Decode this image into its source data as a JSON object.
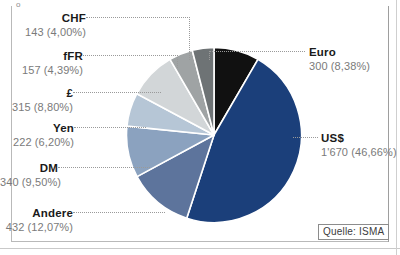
{
  "figure": {
    "source_label": "Quelle: ISMA",
    "corner_mark": "o"
  },
  "chart_data": {
    "type": "pie",
    "title": "",
    "xlabel": "",
    "ylabel": "",
    "legend_position": "callout-labels",
    "grid": false,
    "total": 3579,
    "units": "Mrd.",
    "start_angle_deg": 0,
    "direction": "clockwise",
    "categories": [
      "Euro",
      "US$",
      "Andere",
      "DM",
      "Yen",
      "£",
      "fFR",
      "CHF"
    ],
    "values": [
      300,
      1670,
      432,
      340,
      222,
      315,
      157,
      143
    ],
    "percents": [
      8.38,
      46.66,
      12.07,
      9.5,
      6.2,
      8.8,
      4.39,
      4.0
    ],
    "value_labels": [
      "300",
      "1'670",
      "432",
      "340",
      "222",
      "315",
      "157",
      "143"
    ],
    "percent_labels": [
      "(8,38%)",
      "(46,66%)",
      "(12,07%)",
      "(9,50%)",
      "(6,20%)",
      "(8,80%)",
      "(4,39%)",
      "(4,00%)"
    ],
    "colors": [
      "#111111",
      "#1b3f7a",
      "#5d749c",
      "#8ba2bf",
      "#b6c6d6",
      "#d2d6d8",
      "#9fa3a4",
      "#6e7375"
    ],
    "slice_separator_color": "#ffffff",
    "slices": [
      {
        "name": "Euro",
        "value": 300,
        "value_label": "300",
        "percent": 8.38,
        "percent_label": "(8,38%)",
        "color": "#111111"
      },
      {
        "name": "US$",
        "value": 1670,
        "value_label": "1'670",
        "percent": 46.66,
        "percent_label": "(46,66%)",
        "color": "#1b3f7a"
      },
      {
        "name": "Andere",
        "value": 432,
        "value_label": "432",
        "percent": 12.07,
        "percent_label": "(12,07%)",
        "color": "#5d749c"
      },
      {
        "name": "DM",
        "value": 340,
        "value_label": "340",
        "percent": 9.5,
        "percent_label": "(9,50%)",
        "color": "#8ba2bf"
      },
      {
        "name": "Yen",
        "value": 222,
        "value_label": "222",
        "percent": 6.2,
        "percent_label": "(6,20%)",
        "color": "#b6c6d6"
      },
      {
        "name": "£",
        "value": 315,
        "value_label": "315",
        "percent": 8.8,
        "percent_label": "(8,80%)",
        "color": "#d2d6d8"
      },
      {
        "name": "fFR",
        "value": 157,
        "value_label": "157",
        "percent": 4.39,
        "percent_label": "(4,39%)",
        "color": "#9fa3a4"
      },
      {
        "name": "CHF",
        "value": 143,
        "value_label": "143",
        "percent": 4.0,
        "percent_label": "(4,00%)",
        "color": "#6e7375"
      }
    ]
  }
}
